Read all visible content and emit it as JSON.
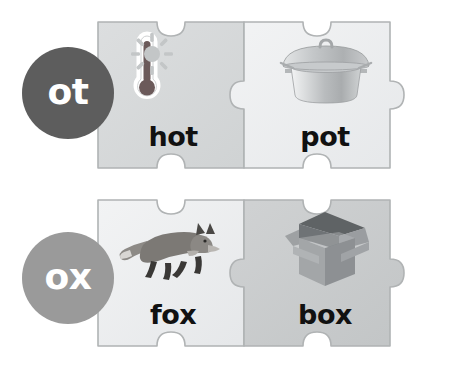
{
  "page": {
    "background_color": "#ffffff"
  },
  "rows": [
    {
      "id": "ot",
      "rime_label": "ot",
      "bubble_color": "#5d5d5d",
      "pieces": [
        {
          "word": "hot",
          "icon": "thermometer-sun-icon",
          "piece_fill": "#d5d7d8",
          "side": "left"
        },
        {
          "word": "pot",
          "icon": "cooking-pot-icon",
          "piece_fill": "#eceef0",
          "side": "right"
        }
      ]
    },
    {
      "id": "ox",
      "rime_label": "ox",
      "bubble_color": "#9a9a9a",
      "pieces": [
        {
          "word": "fox",
          "icon": "fox-icon",
          "piece_fill": "#eceef0",
          "side": "left"
        },
        {
          "word": "box",
          "icon": "open-box-icon",
          "piece_fill": "#c9cbcc",
          "side": "right"
        }
      ]
    }
  ],
  "colors": {
    "word_text": "#111111",
    "bubble_text": "#ffffff",
    "piece_outline": "#b8babb",
    "thermometer_body": "#6b5a5a",
    "sun": "#c2c5c6",
    "pot_body": "#b5b8ba",
    "fox_body": "#787572",
    "box_body": "#a8abad"
  }
}
